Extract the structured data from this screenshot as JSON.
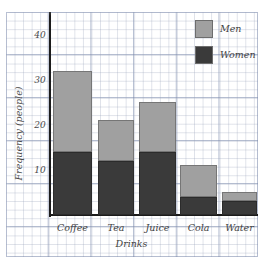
{
  "chart_data": {
    "type": "bar",
    "subtype": "stacked-bar",
    "title": "",
    "xlabel": "Drinks",
    "ylabel": "Frequency (people)",
    "categories": [
      "Coffee",
      "Tea",
      "Juice",
      "Cola",
      "Water"
    ],
    "series": [
      {
        "name": "Women",
        "color": "#3a3a3a",
        "values": [
          14,
          12,
          14,
          4,
          3
        ]
      },
      {
        "name": "Men",
        "color": "#a0a0a0",
        "values": [
          18,
          9,
          11,
          7,
          2
        ]
      }
    ],
    "totals": [
      32,
      21,
      25,
      11,
      5
    ],
    "ylim": [
      0,
      45
    ],
    "yticks": [
      10,
      20,
      30,
      40
    ],
    "ytick_labels": [
      "10",
      "20",
      "30",
      "40"
    ],
    "grid": true,
    "grid_style": "graph-paper",
    "legend_position": "top-right",
    "legend": [
      "Men",
      "Women"
    ]
  },
  "axes": {
    "y_title": "Frequency (people)",
    "x_title": "Drinks"
  },
  "legend": {
    "entries": [
      {
        "label": "Men",
        "color": "#a0a0a0"
      },
      {
        "label": "Women",
        "color": "#3a3a3a"
      }
    ]
  },
  "colors": {
    "men": "#a0a0a0",
    "women": "#3a3a3a",
    "axis": "#1b1b1b",
    "grid_minor": "#96a0b9",
    "grid_major": "#7887aa",
    "paper": "#ffffff",
    "text": "#3f3f3f"
  }
}
